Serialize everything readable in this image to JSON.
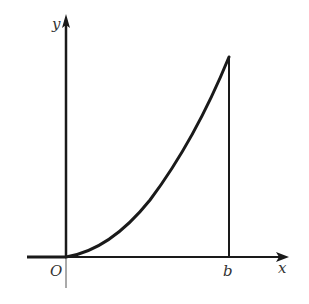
{
  "diagram": {
    "labels": {
      "y_axis": "y",
      "x_axis": "x",
      "origin": "O",
      "b_point": "b"
    },
    "colors": {
      "ink": "#1a1a1a",
      "label": "#333333",
      "background": "#ffffff"
    }
  }
}
